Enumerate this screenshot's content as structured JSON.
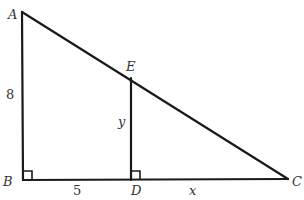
{
  "figure": {
    "type": "geometry-diagram"
  },
  "points": {
    "A": {
      "label": "A",
      "x": 22,
      "y": 12
    },
    "B": {
      "label": "B",
      "x": 23,
      "y": 180
    },
    "C": {
      "label": "C",
      "x": 288,
      "y": 179
    },
    "D": {
      "label": "D",
      "x": 131,
      "y": 180
    },
    "E": {
      "label": "E",
      "x": 131,
      "y": 78
    }
  },
  "segments": [
    {
      "from": "A",
      "to": "B"
    },
    {
      "from": "B",
      "to": "C"
    },
    {
      "from": "A",
      "to": "C"
    },
    {
      "from": "D",
      "to": "E"
    }
  ],
  "right_angles": [
    "B",
    "D"
  ],
  "measurements": {
    "AB": "8",
    "BD": "5",
    "DE": "y",
    "DC": "x"
  },
  "colors": {
    "stroke": "#1a1a1a",
    "text": "#333333",
    "background": "#ffffff"
  }
}
